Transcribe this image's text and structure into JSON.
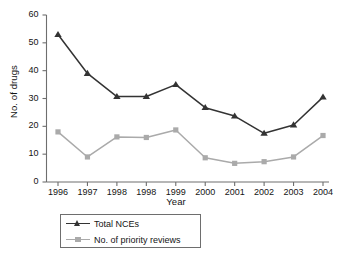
{
  "chart_data": {
    "type": "line",
    "title": "",
    "xlabel": "Year",
    "ylabel": "No. of drugs",
    "categories": [
      "1996",
      "1997",
      "1998",
      "1998",
      "1999",
      "2000",
      "2001",
      "2002",
      "2003",
      "2004"
    ],
    "yticks": [
      0,
      10,
      20,
      30,
      40,
      50,
      60
    ],
    "ylim": [
      0,
      60
    ],
    "grid": false,
    "legend_position": "below-axis-left",
    "series": [
      {
        "name": "Total NCEs",
        "color": "#333333",
        "marker": "triangle",
        "values": [
          53,
          39,
          30.7,
          30.7,
          35,
          26.7,
          23.7,
          17.5,
          20.5,
          30.5
        ]
      },
      {
        "name": "No. of priority reviews",
        "color": "#aaaaaa",
        "marker": "square",
        "values": [
          18,
          9,
          16.2,
          16,
          18.7,
          8.7,
          6.7,
          7.3,
          9,
          16.7
        ]
      }
    ]
  },
  "axis": {
    "line_color": "#6e6e6e",
    "text_color": "#141414"
  }
}
